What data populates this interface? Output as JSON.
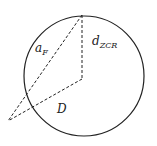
{
  "diagram": {
    "labels": {
      "a_main": "a",
      "a_sub": "F",
      "d_main": "d",
      "d_sub": "ZCR",
      "D": "D"
    },
    "colors": {
      "stroke": "#222222",
      "background": "#ffffff"
    }
  }
}
